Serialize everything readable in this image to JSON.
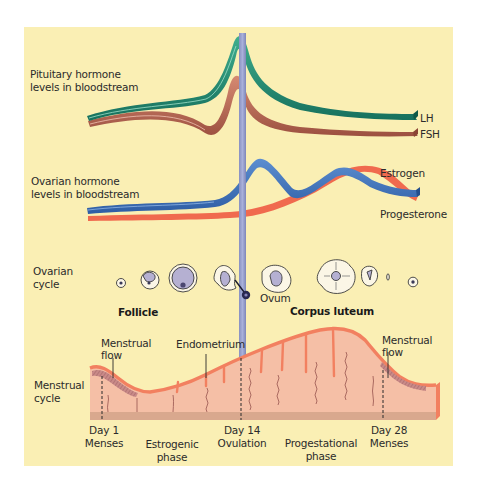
{
  "colors": {
    "background": "#FAEFB4",
    "lh": "#1E8670",
    "fsh": "#B56450",
    "estrogen": "#3A6FB8",
    "progesterone": "#F06A4E",
    "ovulation_bar": "#9AA2CC",
    "endometrium": "#F5BFA6",
    "endometrium_edge": "#F28060",
    "basal_layer": "#D9A88E"
  },
  "pituitary": {
    "label_line1": "Pituitary hormone",
    "label_line2": "levels in bloodstream",
    "series": [
      {
        "name": "LH",
        "label": "LH"
      },
      {
        "name": "FSH",
        "label": "FSH"
      }
    ]
  },
  "ovarian_hormones": {
    "label_line1": "Ovarian hormone",
    "label_line2": "levels in bloodstream",
    "series": [
      {
        "name": "Estrogen",
        "label": "Estrogen"
      },
      {
        "name": "Progesterone",
        "label": "Progesterone"
      }
    ]
  },
  "ovarian_cycle": {
    "label_line1": "Ovarian",
    "label_line2": "cycle",
    "follicle_label": "Follicle",
    "ovum_label": "Ovum",
    "corpus_luteum_label": "Corpus luteum"
  },
  "menstrual_cycle": {
    "label_line1": "Menstrual",
    "label_line2": "cycle",
    "menstrual_flow_left_line1": "Menstrual",
    "menstrual_flow_left_line2": "flow",
    "endometrium_label": "Endometrium",
    "menstrual_flow_right_line1": "Menstrual",
    "menstrual_flow_right_line2": "flow"
  },
  "timeline": {
    "day1_line1": "Day 1",
    "day1_line2": "Menses",
    "estrogenic_line1": "Estrogenic",
    "estrogenic_line2": "phase",
    "day14_line1": "Day 14",
    "day14_line2": "Ovulation",
    "progestational_line1": "Progestational",
    "progestational_line2": "phase",
    "day28_line1": "Day 28",
    "day28_line2": "Menses"
  }
}
